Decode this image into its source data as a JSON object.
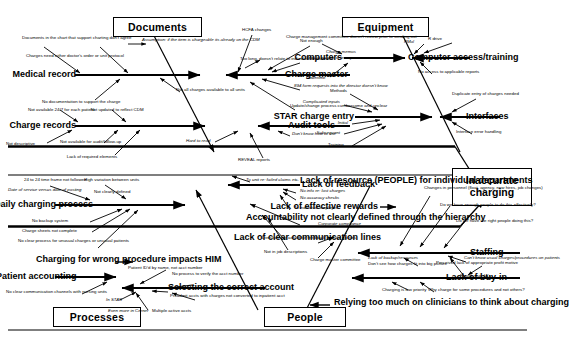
{
  "diagram": {
    "type": "fishbone-ishikawa",
    "effect": "Inaccurate charging",
    "categories": [
      "Documents",
      "Equipment",
      "Processes",
      "People"
    ],
    "colors": {
      "line": "#000000",
      "background": "#ffffff",
      "text": "#000000"
    }
  },
  "documents": {
    "category_label": "Documents",
    "bones": [
      {
        "name": "Medical record",
        "causes": [
          "Documents in the chart that support charting don't agree",
          "Charges need either doctor's order or unit protocol",
          "No documentation to support the charge"
        ]
      },
      {
        "name": "Charge records",
        "causes": [
          "Not available 24/7 for each patient",
          "Not updated to reflect CDM",
          "Not descriptive",
          "Not available for audit/follow-up",
          "Lack of required elements"
        ]
      },
      {
        "name": "Charge master",
        "causes": [
          "HCFA changes",
          "Charge management committee doesn't review prior to sending out",
          "Charge memos",
          "Sent to no one or everyone",
          "Too long, doesn't relate to individual department",
          "894 form requests into the director doesn't know",
          "Update/change process cumbersome and unclear"
        ]
      },
      {
        "name": "Audit tools",
        "causes": [
          "Don't know how to use",
          "Hard to read",
          "REVEAL reports"
        ]
      }
    ],
    "spine_notes": [
      "Assumption: if the item is chargeable its already on the CDM",
      "Not all charges available to all units"
    ]
  },
  "equipment": {
    "category_label": "Equipment",
    "bones": [
      {
        "name": "Computers",
        "causes": [
          "Not enough",
          "Downtime"
        ]
      },
      {
        "name": "Computer access/training",
        "causes": [
          "PMol",
          "R drive",
          "No access to applicable reports"
        ]
      },
      {
        "name": "STAR charge entry",
        "causes": [
          "Methods",
          "Complicated inputs",
          "Initial",
          "Subsequent",
          "Training"
        ]
      },
      {
        "name": "Interfaces",
        "causes": [
          "Duplicate entry of charges needed",
          "Interface error handling"
        ]
      }
    ]
  },
  "processes": {
    "category_label": "Processes",
    "bones": [
      {
        "name": "Daily charging process",
        "causes": [
          "24 to 24 time frame not followed",
          "High variation between units",
          "Date of service versus date of posting",
          "Not clearly defined",
          "No backup system",
          "Charge sheets not complete",
          "No clear process for unusual charges or unusual patients"
        ]
      },
      {
        "name": "Charging for wrong procedure impacts HIM",
        "causes": []
      },
      {
        "name": "Patient accounting",
        "causes": [
          "No clear communication channels with nursing units"
        ]
      },
      {
        "name": "Selecting the correct account",
        "causes": [
          "Patient ID'd by name, not acct number",
          "No process to verify the acct number",
          "Preadmit accts with charges not converted to inpatient acct",
          "In STAR",
          "Even more in Cerner",
          "Multiple active accts"
        ]
      }
    ],
    "spine_notes": [
      "To unit re: failed claims etc."
    ]
  },
  "people": {
    "category_label": "People",
    "bones": [
      {
        "name": "Lack of feedback",
        "causes": [
          "No info re: lost charges",
          "No accuracy checks",
          "To individual employee"
        ]
      },
      {
        "name": "Lack of resource (PEOPLE) for individual departments",
        "causes": []
      },
      {
        "name": "Accountability not clearly defined through the hierarchy",
        "causes": [
          "Directors not asked for feedback by their bosses",
          "Not in job descriptions"
        ]
      },
      {
        "name": "Lack of effective rewards",
        "causes": []
      },
      {
        "name": "Staffing",
        "causes": [
          "Changes in personnel (float, agency, new hires, job changes)",
          "Do we have enough people to do this effectively?",
          "Do we have the right people doing this?",
          "Can't know usual charges/procedures on patients",
          "Floats, esp. IA's",
          "Lack of backup/resources"
        ]
      },
      {
        "name": "Lack of clear communication lines",
        "causes": [
          "Corporate compliance",
          "Charge master committee"
        ]
      },
      {
        "name": "Lack of buy-in",
        "causes": [
          "Don't see how charges fit into big picture",
          "Perceived lack of appropriate profit motive",
          "Charging is low priority",
          "Why charge for some procedures and not others?"
        ]
      },
      {
        "name": "Relying too much on clinicians to think about charging",
        "causes": []
      }
    ]
  }
}
